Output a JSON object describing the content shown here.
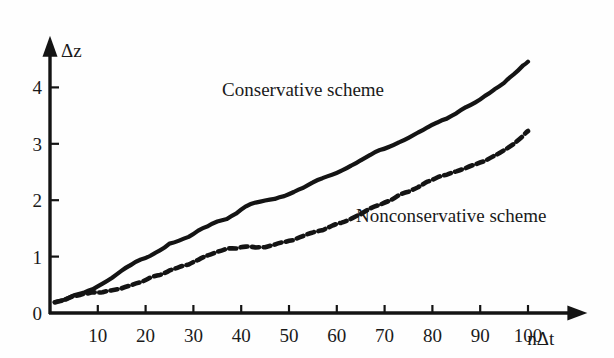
{
  "chart_data": {
    "type": "line",
    "title": "",
    "xlabel": "nΔt",
    "ylabel": "Δz",
    "xlim": [
      0,
      112
    ],
    "ylim": [
      0,
      4.9
    ],
    "grid": false,
    "legend_position": "inline-annotation",
    "xticks": [
      10,
      20,
      30,
      40,
      50,
      60,
      70,
      80,
      90,
      100
    ],
    "xticklabels": [
      "10",
      "20",
      "30",
      "40",
      "50",
      "60",
      "70",
      "80",
      "90",
      "100"
    ],
    "yticks": [
      0,
      1,
      2,
      3,
      4
    ],
    "yticklabels": [
      "0",
      "1",
      "2",
      "3",
      "4"
    ],
    "annotations": [
      {
        "text": "Conservative scheme",
        "x": 36,
        "y": 3.95
      },
      {
        "text": "Nonconservative scheme",
        "x": 64,
        "y": 1.72
      }
    ],
    "series": [
      {
        "name": "Conservative scheme",
        "style": "solid",
        "color": "#141414",
        "x": [
          1,
          3,
          5,
          7,
          9,
          11,
          13,
          15,
          17,
          19,
          21,
          23,
          25,
          27,
          29,
          31,
          33,
          35,
          37,
          39,
          41,
          43,
          45,
          47,
          49,
          51,
          53,
          55,
          57,
          59,
          61,
          63,
          65,
          67,
          69,
          71,
          73,
          75,
          77,
          79,
          81,
          83,
          85,
          87,
          89,
          91,
          93,
          95,
          97,
          99,
          100
        ],
        "y": [
          0.18,
          0.25,
          0.3,
          0.36,
          0.42,
          0.52,
          0.63,
          0.74,
          0.85,
          0.95,
          1.03,
          1.12,
          1.22,
          1.3,
          1.36,
          1.46,
          1.55,
          1.62,
          1.67,
          1.76,
          1.9,
          1.96,
          2.0,
          2.02,
          2.06,
          2.14,
          2.22,
          2.3,
          2.38,
          2.45,
          2.54,
          2.62,
          2.7,
          2.8,
          2.88,
          2.95,
          3.04,
          3.12,
          3.2,
          3.3,
          3.38,
          3.46,
          3.54,
          3.64,
          3.74,
          3.86,
          3.96,
          4.08,
          4.22,
          4.38,
          4.45
        ]
      },
      {
        "name": "Nonconservative scheme",
        "style": "dashed",
        "color": "#141414",
        "x": [
          1,
          3,
          5,
          7,
          9,
          11,
          13,
          15,
          17,
          19,
          21,
          23,
          25,
          27,
          29,
          31,
          33,
          35,
          37,
          39,
          41,
          43,
          45,
          47,
          49,
          51,
          53,
          55,
          57,
          59,
          61,
          63,
          65,
          67,
          69,
          71,
          73,
          75,
          77,
          79,
          81,
          83,
          85,
          87,
          89,
          91,
          93,
          95,
          97,
          99,
          100
        ],
        "y": [
          0.18,
          0.24,
          0.29,
          0.33,
          0.37,
          0.38,
          0.4,
          0.44,
          0.5,
          0.56,
          0.62,
          0.68,
          0.74,
          0.8,
          0.86,
          0.94,
          1.02,
          1.1,
          1.14,
          1.16,
          1.17,
          1.17,
          1.18,
          1.2,
          1.24,
          1.3,
          1.36,
          1.42,
          1.48,
          1.54,
          1.6,
          1.68,
          1.76,
          1.84,
          1.92,
          2.0,
          2.08,
          2.16,
          2.24,
          2.32,
          2.4,
          2.46,
          2.52,
          2.58,
          2.62,
          2.7,
          2.8,
          2.9,
          3.0,
          3.14,
          3.24
        ]
      }
    ]
  },
  "axes": {
    "y_axis_arrow": "up-arrow-icon",
    "x_axis_arrow": "right-arrow-icon"
  }
}
